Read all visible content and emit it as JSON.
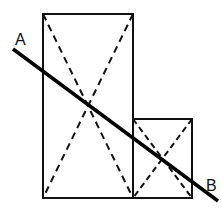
{
  "diagram": {
    "labels": {
      "a": "A",
      "b": "B"
    },
    "colors": {
      "stroke": "#111111",
      "background": "#ffffff"
    },
    "shapes": {
      "large_rectangle": {
        "x": 43,
        "y": 14,
        "w": 90,
        "h": 184
      },
      "small_square": {
        "x": 133,
        "y": 119,
        "w": 59,
        "h": 79
      }
    },
    "line_AB": {
      "x1": 13,
      "y1": 49,
      "x2": 218,
      "y2": 201
    }
  }
}
